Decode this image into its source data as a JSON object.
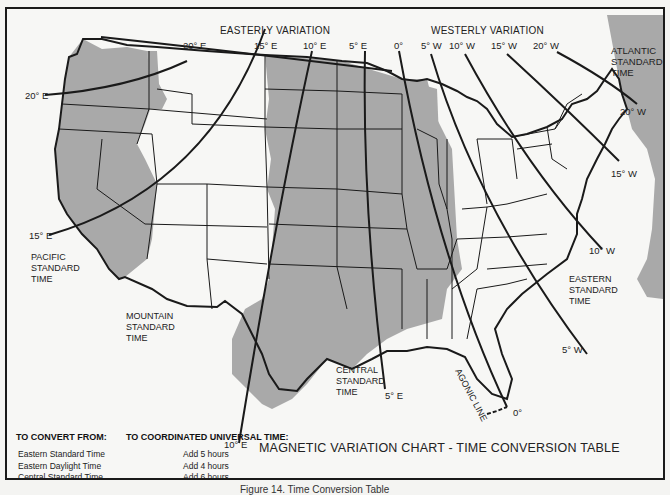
{
  "figure": {
    "title": "MAGNETIC VARIATION CHART - TIME CONVERSION TABLE",
    "caption": "Figure 14. Time Conversion Table"
  },
  "headers": {
    "easterly": "EASTERLY VARIATION",
    "westerly": "WESTERLY VARIATION"
  },
  "isogonic_labels": {
    "e20_top": "20° E",
    "e20_left": "20° E",
    "e15_top": "15° E",
    "e15_left": "15° E",
    "e10_top": "10° E",
    "e10_bottom": "10° E",
    "e5_top": "5° E",
    "e5_bottom": "5° E",
    "zero_top": "0°",
    "zero_bottom": "0°",
    "w5_top": "5° W",
    "w5_bottom": "5° W",
    "w10_top": "10° W",
    "w10_bottom": "10° W",
    "w15_top": "15° W",
    "w15_bottom": "15° W",
    "w20_top": "20° W",
    "w20_bottom": "20° W",
    "agonic": "AGONIC LINE"
  },
  "zones": {
    "pacific": [
      "PACIFIC",
      "STANDARD",
      "TIME"
    ],
    "mountain": [
      "MOUNTAIN",
      "STANDARD",
      "TIME"
    ],
    "central": [
      "CENTRAL",
      "STANDARD",
      "TIME"
    ],
    "eastern": [
      "EASTERN",
      "STANDARD",
      "TIME"
    ],
    "atlantic": [
      "ATLANTIC",
      "STANDARD",
      "TIME"
    ]
  },
  "colors": {
    "shaded_zone": "#a9a9a9",
    "unshaded_zone": "#f7f7f5",
    "line": "#1a1a1a"
  },
  "conversion_table": {
    "col_from": "TO CONVERT FROM:",
    "col_to": "TO COORDINATED UNIVERSAL TIME:",
    "rows": [
      {
        "from": "Eastern Standard Time",
        "to": "Add 5 hours"
      },
      {
        "from": "Eastern Daylight Time",
        "to": "Add 4 hours"
      },
      {
        "from": "Central Standard Time",
        "to": "Add 6 hours"
      },
      {
        "from": "Central Daylight Time",
        "to": "Add 5 hours"
      },
      {
        "from": "Mountain Standard Time",
        "to": "Add 7 hours"
      },
      {
        "from": "Mountain Daylight Time",
        "to": "Add 6 hours"
      },
      {
        "from": "Pacific Standard Time",
        "to": "Add 8 hours"
      },
      {
        "from": "Pacific DaylightTime",
        "to": "Add 7 hours"
      }
    ]
  }
}
